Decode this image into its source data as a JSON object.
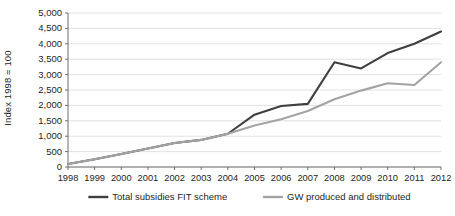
{
  "chart_data": {
    "type": "line",
    "title": "",
    "xlabel": "",
    "ylabel": "Index 1998 = 100",
    "x": [
      1998,
      1999,
      2000,
      2001,
      2002,
      2003,
      2004,
      2005,
      2006,
      2007,
      2008,
      2009,
      2010,
      2011,
      2012
    ],
    "xtick_labels": [
      "1998",
      "1999",
      "2000",
      "2001",
      "2002",
      "2003",
      "2004",
      "2005",
      "2006",
      "2007",
      "2008",
      "2009",
      "2010",
      "2011",
      "2012"
    ],
    "ytick_labels": [
      "0",
      "500",
      "1,000",
      "1,500",
      "2,000",
      "2,500",
      "3,000",
      "3,500",
      "4,000",
      "4,500",
      "5,000"
    ],
    "ytick_values": [
      0,
      500,
      1000,
      1500,
      2000,
      2500,
      3000,
      3500,
      4000,
      4500,
      5000
    ],
    "ylim": [
      0,
      5000
    ],
    "xlim": [
      1998,
      2012
    ],
    "grid": true,
    "legend_position": "bottom",
    "series": [
      {
        "name": "Total subsidies FIT scheme",
        "color": "#3f3f3f",
        "values": [
          100,
          250,
          420,
          600,
          780,
          880,
          1080,
          1700,
          1980,
          2050,
          3400,
          3200,
          3700,
          4000,
          4400
        ]
      },
      {
        "name": "GW produced and distributed",
        "color": "#a3a3a3",
        "values": [
          100,
          250,
          420,
          600,
          780,
          880,
          1080,
          1350,
          1550,
          1820,
          2200,
          2480,
          2720,
          2660,
          3400
        ]
      }
    ]
  },
  "legend": {
    "entries": [
      {
        "label": "Total subsidies FIT scheme",
        "color": "#3f3f3f"
      },
      {
        "label": "GW produced and distributed",
        "color": "#a3a3a3"
      }
    ]
  },
  "axis": {
    "y_title": "Index 1998 = 100"
  }
}
